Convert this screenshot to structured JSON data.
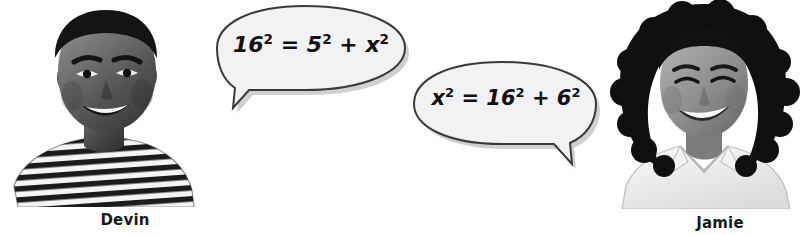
{
  "scene": {
    "width": 808,
    "height": 235,
    "background_color": "#ffffff",
    "description": "Two students with speech bubbles containing Pythagorean theorem equations"
  },
  "students": [
    {
      "id": "devin",
      "name": "Devin",
      "photo_alt": "Smiling young man wearing a horizontally striped shirt, black and white photo",
      "side": "left"
    },
    {
      "id": "jamie",
      "name": "Jamie",
      "photo_alt": "Smiling young woman with curly hair wearing a light collared shirt, black and white photo",
      "side": "right"
    }
  ],
  "speech_bubbles": [
    {
      "id": "bubble-devin",
      "speaker": "Devin",
      "tail_direction": "down-left",
      "equation_plain": "16^2 = 5^2 + x^2",
      "equation_parts": [
        {
          "base": "16",
          "exp": "2"
        },
        {
          "op": "="
        },
        {
          "base": "5",
          "exp": "2"
        },
        {
          "op": "+"
        },
        {
          "base": "x",
          "exp": "2"
        }
      ]
    },
    {
      "id": "bubble-jamie",
      "speaker": "Jamie",
      "tail_direction": "down-right",
      "equation_plain": "x^2 = 16^2 + 6^2",
      "equation_parts": [
        {
          "base": "x",
          "exp": "2"
        },
        {
          "op": "="
        },
        {
          "base": "16",
          "exp": "2"
        },
        {
          "op": "+"
        },
        {
          "base": "6",
          "exp": "2"
        }
      ]
    }
  ],
  "colors": {
    "bubble_fill": "#f2f2f2",
    "bubble_stroke": "#3a3a3a",
    "bubble_shadow": "#9a9a9a",
    "text": "#111111",
    "caption_text": "#1a1a1a",
    "background": "#ffffff"
  }
}
